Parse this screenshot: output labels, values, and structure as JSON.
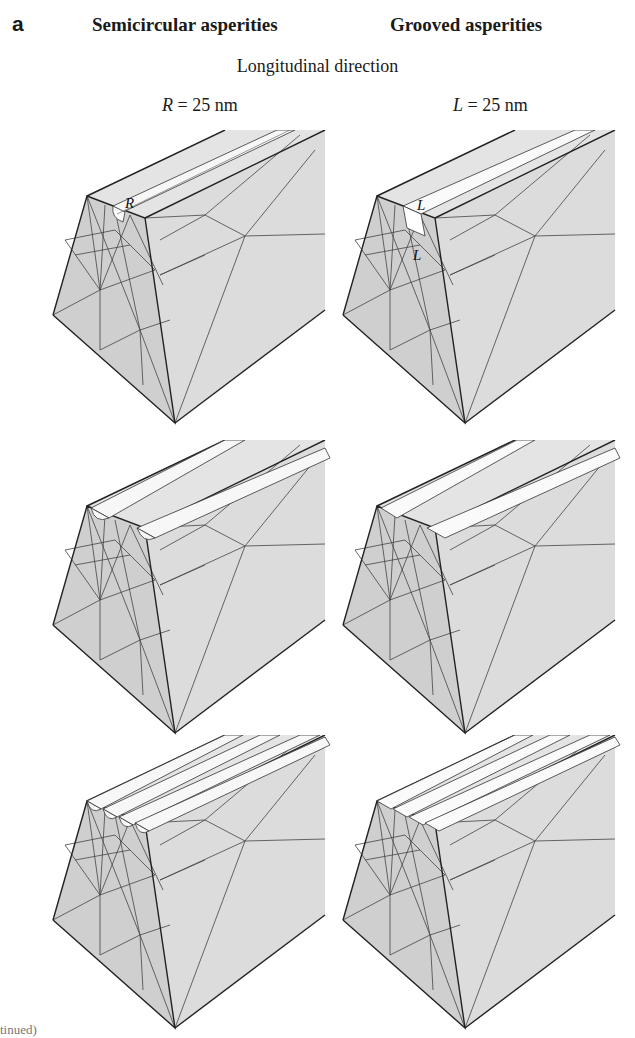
{
  "figure": {
    "panel_label": "a",
    "columns": [
      {
        "title": "Semicircular asperities",
        "param_symbol": "R",
        "param_value": "= 25 nm"
      },
      {
        "title": "Grooved asperities",
        "param_symbol": "L",
        "param_value": "= 25 nm"
      }
    ],
    "subtitle": "Longitudinal direction",
    "rows": [
      {
        "asperity_count": 1
      },
      {
        "asperity_count": 2
      },
      {
        "asperity_count": 4
      }
    ],
    "annotations": {
      "semicircular_radius": "R",
      "groove_width": "L",
      "groove_depth": "L"
    },
    "colors": {
      "mesh_fill": "#d4d4d4",
      "asperity_fill": "#f5f5f5",
      "edge_stroke": "#2a2a2a"
    }
  },
  "footer": {
    "text": "tinued)"
  }
}
